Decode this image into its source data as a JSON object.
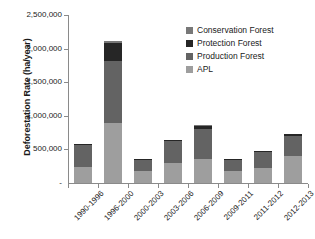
{
  "chart_data": {
    "type": "bar",
    "stacked": true,
    "title": "",
    "xlabel": "",
    "ylabel": "Deforestation Rate (ha/year)",
    "ylim": [
      0,
      2500000
    ],
    "ytick_step": 500000,
    "yticks": [
      "0",
      "500,000",
      "1,000,000",
      "1,500,000",
      "2,000,000",
      "2,500,000"
    ],
    "ytick_labels_visible": [
      "500,000",
      "1,000,000",
      "1,500,000",
      "2,000,000",
      "2,500,000"
    ],
    "grid": false,
    "legend_position": "top-right",
    "categories": [
      "1990-1996",
      "1996-2000",
      "2000-2003",
      "2003-2006",
      "2006-2009",
      "2009-2011",
      "2011-2012",
      "2012-2013"
    ],
    "series": [
      {
        "name": "APL",
        "color": "#9e9e9e",
        "values": [
          245000,
          900000,
          180000,
          300000,
          350000,
          185000,
          230000,
          405000
        ]
      },
      {
        "name": "Production Forest",
        "color": "#636363",
        "values": [
          325000,
          915000,
          160000,
          320000,
          455000,
          165000,
          225000,
          295000
        ]
      },
      {
        "name": "Protection Forest",
        "color": "#262626",
        "values": [
          5000,
          270000,
          10000,
          15000,
          45000,
          5000,
          15000,
          25000
        ]
      },
      {
        "name": "Conservation Forest",
        "color": "#787878",
        "values": [
          0,
          25000,
          0,
          0,
          10000,
          0,
          0,
          0
        ]
      }
    ],
    "totals": [
      575000,
      2110000,
      350000,
      635000,
      860000,
      355000,
      470000,
      725000
    ]
  },
  "legend": {
    "items": [
      {
        "label": "Conservation Forest",
        "color": "#787878"
      },
      {
        "label": "Protection Forest",
        "color": "#262626"
      },
      {
        "label": "Production Forest",
        "color": "#636363"
      },
      {
        "label": "APL",
        "color": "#9e9e9e"
      }
    ]
  },
  "axis": {
    "axis_color": "#8a8a8a"
  }
}
